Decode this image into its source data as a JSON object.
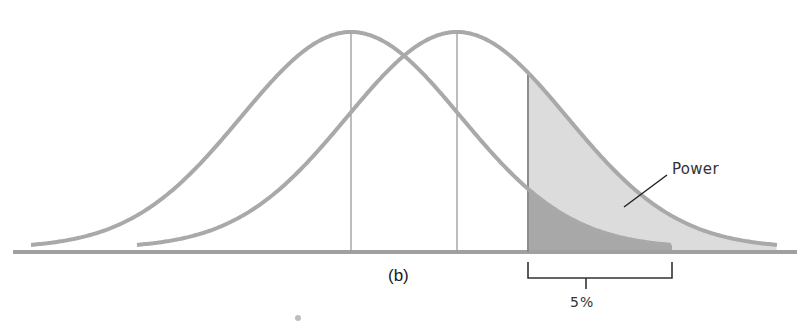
{
  "figure": {
    "panel_label": "(b)",
    "power_label": "Power",
    "alpha_label": "5%"
  },
  "colors": {
    "curve": "#a9a9a9",
    "baseline": "#a0a0a0",
    "power_fill": "#dcdcdc",
    "alpha_fill": "#a8a8a8",
    "vline": "#9a9a9a",
    "bracket": "#333333"
  },
  "geometry": {
    "baseline_y": 252,
    "peak_height": 220,
    "sigma": 110,
    "null_mean_x": 351,
    "alt_mean_x": 457,
    "critical_x": 528,
    "null_range": [
      31,
      672
    ],
    "alt_range": [
      137,
      777
    ],
    "axis_range": [
      13,
      797
    ]
  }
}
